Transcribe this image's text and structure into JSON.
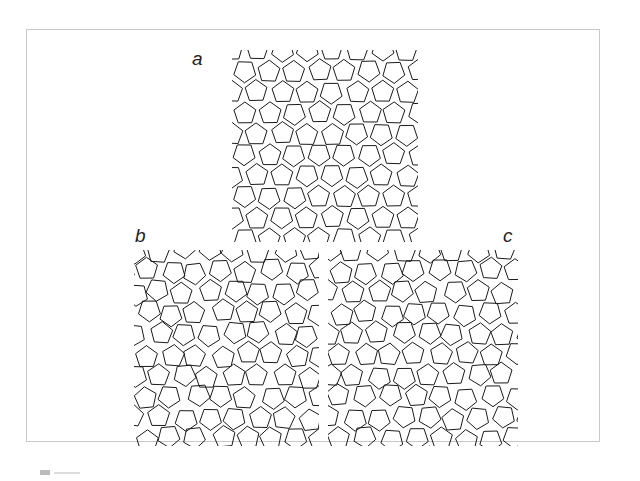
{
  "figure": {
    "panels": [
      {
        "id": "a",
        "label": "a"
      },
      {
        "id": "b",
        "label": "b"
      },
      {
        "id": "c",
        "label": "c"
      }
    ],
    "colors": {
      "line": "#1a1a1a",
      "frame": "#c8c8c8",
      "background": "#ffffff"
    }
  }
}
